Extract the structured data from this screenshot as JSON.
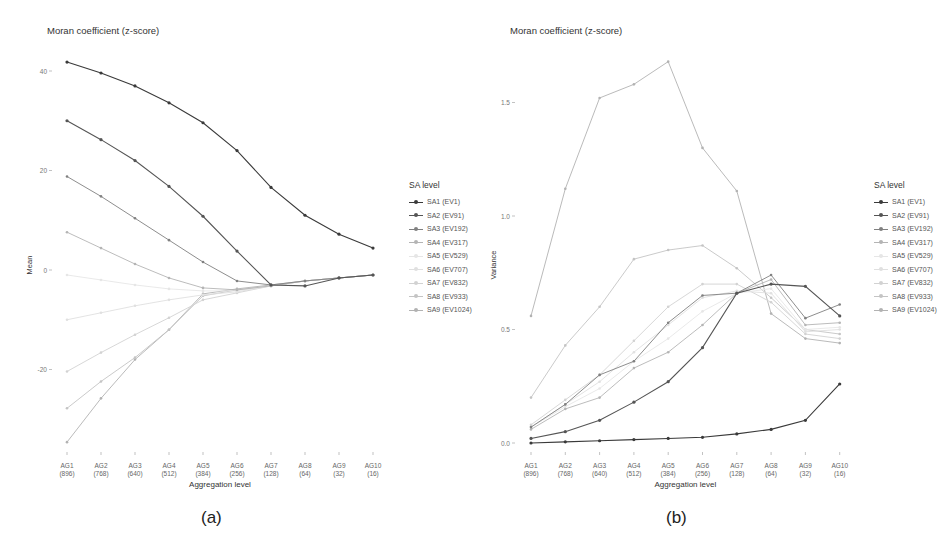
{
  "panels": [
    {
      "id": "a",
      "title": "Moran coefficient (z-score)",
      "caption": "(a)",
      "ylabel": "Mean",
      "xlabel": "Aggregation level",
      "legend_title": "SA level"
    },
    {
      "id": "b",
      "title": "Moran coefficient (z-score)",
      "caption": "(b)",
      "ylabel": "Variance",
      "xlabel": "Aggregation level",
      "legend_title": "SA level"
    }
  ],
  "legend": {
    "title": "SA level",
    "items": [
      {
        "label": "SA1 (EV1)",
        "color": "#3a3a3a"
      },
      {
        "label": "SA2 (EV91)",
        "color": "#555555"
      },
      {
        "label": "SA3 (EV192)",
        "color": "#808080"
      },
      {
        "label": "SA4 (EV317)",
        "color": "#b4b4b4"
      },
      {
        "label": "SA5 (EV529)",
        "color": "#e6e6e6"
      },
      {
        "label": "SA6 (EV707)",
        "color": "#e0e0e0"
      },
      {
        "label": "SA7 (EV832)",
        "color": "#d2d2d2"
      },
      {
        "label": "SA8 (EV933)",
        "color": "#c4c4c4"
      },
      {
        "label": "SA9 (EV1024)",
        "color": "#b2b2b2"
      }
    ]
  },
  "chart_data": [
    {
      "type": "line",
      "title": "Moran coefficient (z-score)",
      "xlabel": "Aggregation level",
      "ylabel": "Mean",
      "categories": [
        "AG1\n(896)",
        "AG2\n(768)",
        "AG3\n(640)",
        "AG4\n(512)",
        "AG5\n(384)",
        "AG6\n(256)",
        "AG7\n(128)",
        "AG8\n(64)",
        "AG9\n(32)",
        "AG10\n(16)"
      ],
      "ylim": [
        -36,
        44
      ],
      "yticks": [
        -20,
        0,
        20,
        40
      ],
      "legend_title": "SA level",
      "legend_position": "right",
      "grid": false,
      "series": [
        {
          "name": "SA1 (EV1)",
          "values": [
            41.8,
            39.6,
            37.0,
            33.6,
            29.6,
            24.0,
            16.6,
            11.0,
            7.2,
            4.4
          ]
        },
        {
          "name": "SA2 (EV91)",
          "values": [
            30.0,
            26.2,
            22.0,
            16.8,
            10.8,
            3.8,
            -3.0,
            -3.2,
            -1.6,
            -1.0
          ]
        },
        {
          "name": "SA3 (EV192)",
          "values": [
            18.8,
            14.8,
            10.4,
            6.0,
            1.6,
            -2.2,
            -3.0,
            -2.2,
            -1.6,
            -1.0
          ]
        },
        {
          "name": "SA4 (EV317)",
          "values": [
            7.6,
            4.4,
            1.2,
            -1.6,
            -3.6,
            -4.0,
            -3.2,
            -2.2,
            -1.6,
            -1.0
          ]
        },
        {
          "name": "SA5 (EV529)",
          "values": [
            -1.0,
            -2.0,
            -3.0,
            -3.8,
            -4.2,
            -4.2,
            -3.2,
            -2.2,
            -1.6,
            -1.0
          ]
        },
        {
          "name": "SA6 (EV707)",
          "values": [
            -10.0,
            -8.6,
            -7.2,
            -6.0,
            -5.0,
            -4.4,
            -3.2,
            -2.2,
            -1.6,
            -1.0
          ]
        },
        {
          "name": "SA7 (EV832)",
          "values": [
            -20.4,
            -16.6,
            -13.0,
            -9.6,
            -6.0,
            -4.6,
            -3.2,
            -2.2,
            -1.6,
            -1.0
          ]
        },
        {
          "name": "SA8 (EV933)",
          "values": [
            -27.8,
            -22.4,
            -17.6,
            -12.0,
            -5.2,
            -4.0,
            -3.2,
            -2.2,
            -1.6,
            -1.0
          ]
        },
        {
          "name": "SA9 (EV1024)",
          "values": [
            -34.6,
            -25.8,
            -18.0,
            -12.0,
            -4.8,
            -3.8,
            -3.0,
            -2.2,
            -1.6,
            -1.0
          ]
        }
      ]
    },
    {
      "type": "line",
      "title": "Moran coefficient (z-score)",
      "xlabel": "Aggregation level",
      "ylabel": "Variance",
      "categories": [
        "AG1\n(896)",
        "AG2\n(768)",
        "AG3\n(640)",
        "AG4\n(512)",
        "AG5\n(384)",
        "AG6\n(256)",
        "AG7\n(128)",
        "AG8\n(64)",
        "AG9\n(32)",
        "AG10\n(16)"
      ],
      "ylim": [
        -0.05,
        1.75
      ],
      "yticks": [
        0.0,
        0.5,
        1.0,
        1.5
      ],
      "legend_title": "SA level",
      "legend_position": "right",
      "grid": false,
      "series": [
        {
          "name": "SA1 (EV1)",
          "values": [
            0.0,
            0.005,
            0.01,
            0.015,
            0.02,
            0.025,
            0.04,
            0.06,
            0.1,
            0.26
          ]
        },
        {
          "name": "SA2 (EV91)",
          "values": [
            0.02,
            0.05,
            0.1,
            0.18,
            0.27,
            0.42,
            0.66,
            0.7,
            0.69,
            0.56
          ]
        },
        {
          "name": "SA3 (EV192)",
          "values": [
            0.07,
            0.17,
            0.3,
            0.36,
            0.53,
            0.65,
            0.66,
            0.74,
            0.55,
            0.61
          ]
        },
        {
          "name": "SA4 (EV317)",
          "values": [
            0.06,
            0.15,
            0.2,
            0.33,
            0.4,
            0.52,
            0.66,
            0.72,
            0.52,
            0.53
          ]
        },
        {
          "name": "SA5 (EV529)",
          "values": [
            0.07,
            0.16,
            0.24,
            0.36,
            0.46,
            0.58,
            0.66,
            0.68,
            0.5,
            0.51
          ]
        },
        {
          "name": "SA6 (EV707)",
          "values": [
            0.07,
            0.17,
            0.27,
            0.4,
            0.52,
            0.64,
            0.67,
            0.66,
            0.49,
            0.5
          ]
        },
        {
          "name": "SA7 (EV832)",
          "values": [
            0.08,
            0.19,
            0.3,
            0.45,
            0.6,
            0.7,
            0.7,
            0.62,
            0.48,
            0.46
          ]
        },
        {
          "name": "SA8 (EV933)",
          "values": [
            0.2,
            0.43,
            0.6,
            0.81,
            0.85,
            0.87,
            0.77,
            0.64,
            0.5,
            0.48
          ]
        },
        {
          "name": "SA9 (EV1024)",
          "values": [
            0.56,
            1.12,
            1.52,
            1.58,
            1.68,
            1.3,
            1.11,
            0.57,
            0.46,
            0.44
          ]
        }
      ]
    }
  ]
}
